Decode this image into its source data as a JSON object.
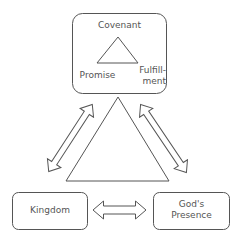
{
  "diagram": {
    "top_box": {
      "title": "Covenant",
      "left_label": "Promise",
      "right_label_line1": "Fulfill-",
      "right_label_line2": "ment"
    },
    "bottom_left_box": {
      "label": "Kingdom"
    },
    "bottom_right_box": {
      "label_line1": "God's",
      "label_line2": "Presence"
    },
    "connectors": [
      {
        "from": "Covenant",
        "to": "Kingdom",
        "type": "double-arrow"
      },
      {
        "from": "Covenant",
        "to": "God's Presence",
        "type": "double-arrow"
      },
      {
        "from": "Kingdom",
        "to": "God's Presence",
        "type": "double-arrow"
      }
    ],
    "colors": {
      "stroke": "#555555",
      "text": "#555555",
      "background": "#ffffff"
    }
  }
}
